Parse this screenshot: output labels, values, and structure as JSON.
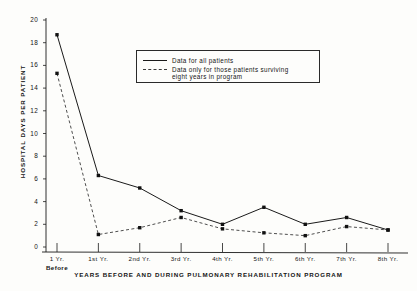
{
  "chart_data": {
    "type": "line",
    "title": "",
    "xlabel": "YEARS BEFORE AND DURING PULMONARY REHABILITATION PROGRAM",
    "ylabel": "HOSPITAL DAYS PER PATIENT",
    "categories": [
      "1 Yr. Before",
      "1st Yr.",
      "2nd Yr.",
      "3rd Yr.",
      "4th Yr.",
      "5th Yr.",
      "6th Yr.",
      "7th Yr.",
      "8th Yr."
    ],
    "category_labels": [
      {
        "main": "1 Yr.",
        "sub": "Before"
      },
      {
        "main": "1st Yr.",
        "sub": ""
      },
      {
        "main": "2nd Yr.",
        "sub": ""
      },
      {
        "main": "3rd Yr.",
        "sub": ""
      },
      {
        "main": "4th Yr.",
        "sub": ""
      },
      {
        "main": "5th Yr.",
        "sub": ""
      },
      {
        "main": "6th Yr.",
        "sub": ""
      },
      {
        "main": "7th Yr.",
        "sub": ""
      },
      {
        "main": "8th Yr.",
        "sub": ""
      }
    ],
    "series": [
      {
        "name": "Data for all patients",
        "style": "solid",
        "color": "#1a1a1a",
        "values": [
          18.7,
          6.3,
          5.2,
          3.2,
          2.0,
          3.5,
          2.0,
          2.6,
          1.5
        ]
      },
      {
        "name": "Data only for those patients surviving eight years in program",
        "style": "dashed",
        "color": "#3a3a3a",
        "values": [
          15.3,
          1.1,
          1.7,
          2.6,
          1.6,
          1.25,
          1.0,
          1.8,
          1.5
        ]
      }
    ],
    "ylim": [
      0,
      20
    ],
    "yticks": [
      0,
      2,
      4,
      6,
      8,
      10,
      12,
      14,
      16,
      18,
      20
    ],
    "ytick_labels": [
      "0",
      "2",
      "4",
      "6",
      "8",
      "10",
      "12",
      "14",
      "16",
      "18",
      "20"
    ],
    "grid": false,
    "legend_position": "top-center",
    "legend": {
      "entries": [
        {
          "label": "Data for all patients",
          "style": "solid"
        },
        {
          "label": "Data only for those patients surviving",
          "style": "dashed"
        }
      ],
      "continuation": "eight years in program"
    },
    "marker": "filled-square",
    "background_color": "#fdfdfb",
    "axis_color": "#1a1a1a"
  }
}
